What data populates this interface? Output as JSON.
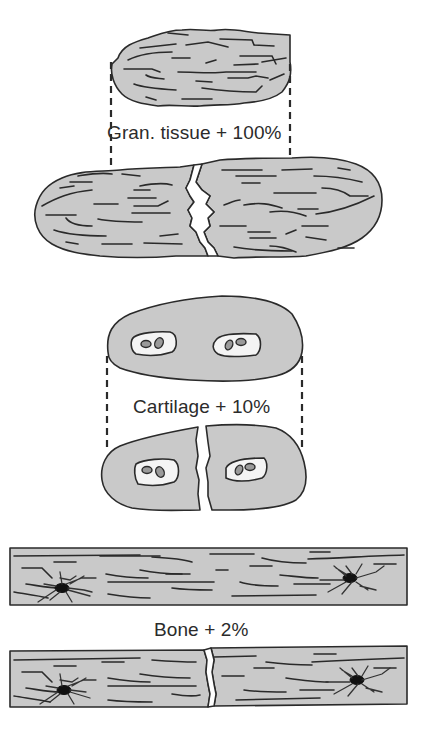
{
  "figure": {
    "panels": [
      {
        "id": "granulation-tissue",
        "label": "Gran. tissue + 100%",
        "tissue": "Granulation tissue",
        "strain_tolerance_percent": 100,
        "description": "Fibrous tissue elongates to double its length before rupture"
      },
      {
        "id": "cartilage",
        "label": "Cartilage + 10%",
        "tissue": "Cartilage",
        "strain_tolerance_percent": 10,
        "description": "Cartilage with chondrocyte lacunae tolerates 10% strain before fracture"
      },
      {
        "id": "bone",
        "label": "Bone + 2%",
        "tissue": "Bone",
        "strain_tolerance_percent": 2,
        "description": "Lamellar bone with osteocytes tolerates 2% strain before fracture"
      }
    ],
    "colors": {
      "tissue_fill": "#c9c9c9",
      "outline": "#2a2a2a",
      "lacuna_fill": "#f4f4f4",
      "cell_fill": "#9a9a9a",
      "osteocyte": "#111111",
      "background": "#ffffff"
    }
  }
}
